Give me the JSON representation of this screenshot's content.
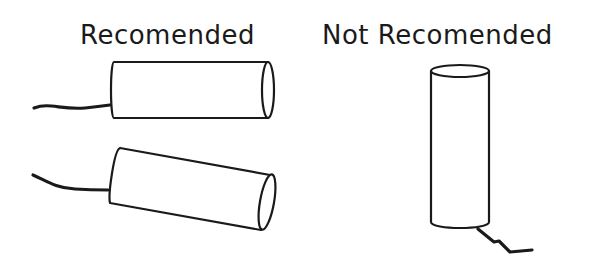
{
  "diagram": {
    "labels": {
      "recommended": "Recomended",
      "not_recommended": "Not Recomended"
    },
    "panels": [
      {
        "label": "Recomended",
        "items": [
          {
            "shape": "cylinder",
            "orientation": "horizontal",
            "cable_side": "left"
          },
          {
            "shape": "cylinder",
            "orientation": "tilted-down-right",
            "cable_side": "left"
          }
        ]
      },
      {
        "label": "Not Recomended",
        "items": [
          {
            "shape": "cylinder",
            "orientation": "vertical",
            "cable_side": "bottom"
          }
        ]
      }
    ],
    "colors": {
      "stroke": "#1a1a1a",
      "background": "#ffffff"
    }
  }
}
